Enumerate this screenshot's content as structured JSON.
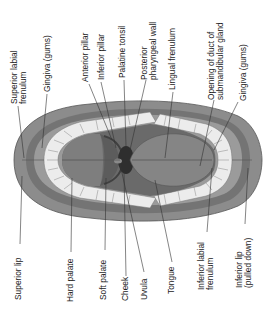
{
  "diagram": {
    "labels_top": [
      {
        "id": "superior-labial-frenulum",
        "lines": [
          "Superior labial",
          "frenulum"
        ]
      },
      {
        "id": "gingiva-upper",
        "lines": [
          "Gingiva (gums)"
        ]
      },
      {
        "id": "anterior-pillar",
        "lines": [
          "Anterior pillar"
        ]
      },
      {
        "id": "inferior-pillar",
        "lines": [
          "Inferior pillar"
        ]
      },
      {
        "id": "palatine-tonsil",
        "lines": [
          "Palatine tonsil"
        ]
      },
      {
        "id": "posterior-pharyngeal-wall",
        "lines": [
          "Posterior",
          "pharyngeal wall"
        ]
      },
      {
        "id": "lingual-frenulum",
        "lines": [
          "Lingual frenulum"
        ]
      },
      {
        "id": "opening-of-duct",
        "lines": [
          "Opening of duct of",
          "submandibular gland"
        ]
      },
      {
        "id": "gingiva-lower",
        "lines": [
          "Gingiva (gums)"
        ]
      }
    ],
    "labels_bottom": [
      {
        "id": "superior-lip",
        "lines": [
          "Superior lip"
        ]
      },
      {
        "id": "hard-palate",
        "lines": [
          "Hard palate"
        ]
      },
      {
        "id": "soft-palate",
        "lines": [
          "Soft palate"
        ]
      },
      {
        "id": "cheek",
        "lines": [
          "Cheek"
        ]
      },
      {
        "id": "uvula",
        "lines": [
          "Uvula"
        ]
      },
      {
        "id": "tongue",
        "lines": [
          "Tongue"
        ]
      },
      {
        "id": "inferior-labial-frenulum",
        "lines": [
          "Inferior labial",
          "frenulum"
        ]
      },
      {
        "id": "inferior-lip",
        "lines": [
          "Inferior lip",
          "(pulled down)"
        ]
      }
    ],
    "colors": {
      "lip": "#8a8a8a",
      "lip_dark": "#6a6a6a",
      "gum": "#9a9a9a",
      "palate": "#707070",
      "throat": "#3a3a3a",
      "tongue": "#7c7c7c",
      "teeth": "#f2f2f2",
      "leader": "#333333",
      "text": "#222222"
    }
  }
}
